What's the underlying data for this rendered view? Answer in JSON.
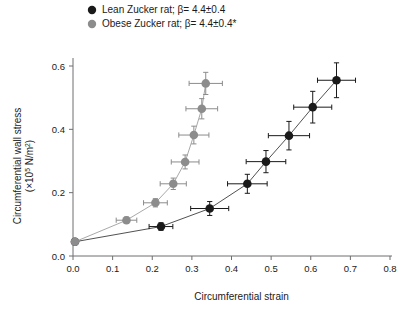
{
  "chart_data": {
    "type": "scatter",
    "title": "",
    "xlabel": "Circumferential strain",
    "ylabel_line1": "Circumferential wall stress",
    "ylabel_line2_pre": "(×10",
    "ylabel_line2_sup": "5",
    "ylabel_line2_post": " N/m",
    "ylabel_line2_sup2": "2",
    "ylabel_line2_end": ")",
    "ylabel": "Circumferential wall stress (×10⁵ N/m²)",
    "xlim": [
      0.0,
      0.8
    ],
    "ylim": [
      0.0,
      0.65
    ],
    "xticks": [
      "0.0",
      "0.1",
      "0.2",
      "0.3",
      "0.4",
      "0.5",
      "0.6",
      "0.7",
      "0.8"
    ],
    "xtick_values": [
      0.0,
      0.1,
      0.2,
      0.3,
      0.4,
      0.5,
      0.6,
      0.7,
      0.8
    ],
    "yticks": [
      "0.0",
      "0.2",
      "0.4",
      "0.6"
    ],
    "ytick_values": [
      0.0,
      0.2,
      0.4,
      0.6
    ],
    "grid": false,
    "legend_position": "top-left",
    "series": [
      {
        "name": "lean",
        "label": "Lean Zucker rat; β= 4.4±0.4",
        "color": "#1a1a1a",
        "marker": "circle",
        "points": [
          {
            "x": 0.005,
            "y": 0.045,
            "xerr_lo": 0.0,
            "xerr_hi": 0.0,
            "yerr_lo": 0.0,
            "yerr_hi": 0.0
          },
          {
            "x": 0.222,
            "y": 0.093,
            "xerr_lo": 0.03,
            "xerr_hi": 0.03,
            "yerr_lo": 0.012,
            "yerr_hi": 0.012
          },
          {
            "x": 0.345,
            "y": 0.15,
            "xerr_lo": 0.048,
            "xerr_hi": 0.048,
            "yerr_lo": 0.022,
            "yerr_hi": 0.022
          },
          {
            "x": 0.44,
            "y": 0.228,
            "xerr_lo": 0.05,
            "xerr_hi": 0.05,
            "yerr_lo": 0.03,
            "yerr_hi": 0.03
          },
          {
            "x": 0.487,
            "y": 0.298,
            "xerr_lo": 0.05,
            "xerr_hi": 0.05,
            "yerr_lo": 0.035,
            "yerr_hi": 0.035
          },
          {
            "x": 0.545,
            "y": 0.38,
            "xerr_lo": 0.052,
            "xerr_hi": 0.052,
            "yerr_lo": 0.045,
            "yerr_hi": 0.045
          },
          {
            "x": 0.605,
            "y": 0.47,
            "xerr_lo": 0.048,
            "xerr_hi": 0.048,
            "yerr_lo": 0.05,
            "yerr_hi": 0.05
          },
          {
            "x": 0.665,
            "y": 0.555,
            "xerr_lo": 0.048,
            "xerr_hi": 0.048,
            "yerr_lo": 0.055,
            "yerr_hi": 0.055
          }
        ]
      },
      {
        "name": "obese",
        "label": "Obese Zucker rat; β= 4.4±0.4*",
        "color": "#8c8c8c",
        "marker": "circle",
        "points": [
          {
            "x": 0.005,
            "y": 0.045,
            "xerr_lo": 0.0,
            "xerr_hi": 0.0,
            "yerr_lo": 0.0,
            "yerr_hi": 0.0
          },
          {
            "x": 0.135,
            "y": 0.113,
            "xerr_lo": 0.026,
            "xerr_hi": 0.026,
            "yerr_lo": 0.01,
            "yerr_hi": 0.01
          },
          {
            "x": 0.208,
            "y": 0.168,
            "xerr_lo": 0.03,
            "xerr_hi": 0.03,
            "yerr_lo": 0.013,
            "yerr_hi": 0.013
          },
          {
            "x": 0.253,
            "y": 0.228,
            "xerr_lo": 0.033,
            "xerr_hi": 0.033,
            "yerr_lo": 0.018,
            "yerr_hi": 0.018
          },
          {
            "x": 0.283,
            "y": 0.297,
            "xerr_lo": 0.035,
            "xerr_hi": 0.035,
            "yerr_lo": 0.022,
            "yerr_hi": 0.022
          },
          {
            "x": 0.305,
            "y": 0.382,
            "xerr_lo": 0.038,
            "xerr_hi": 0.038,
            "yerr_lo": 0.028,
            "yerr_hi": 0.028
          },
          {
            "x": 0.325,
            "y": 0.465,
            "xerr_lo": 0.04,
            "xerr_hi": 0.04,
            "yerr_lo": 0.032,
            "yerr_hi": 0.032
          },
          {
            "x": 0.335,
            "y": 0.545,
            "xerr_lo": 0.042,
            "xerr_hi": 0.042,
            "yerr_lo": 0.035,
            "yerr_hi": 0.035
          }
        ]
      }
    ]
  },
  "legend": {
    "items": [
      {
        "label": "Lean Zucker rat; β= 4.4±0.4",
        "color": "#1a1a1a"
      },
      {
        "label": "Obese Zucker rat; β= 4.4±0.4*",
        "color": "#8c8c8c"
      }
    ]
  },
  "colors": {
    "lean": "#1a1a1a",
    "obese": "#8c8c8c",
    "axis": "#6e6e6e",
    "text": "#1a1a1a",
    "background": "#ffffff"
  }
}
